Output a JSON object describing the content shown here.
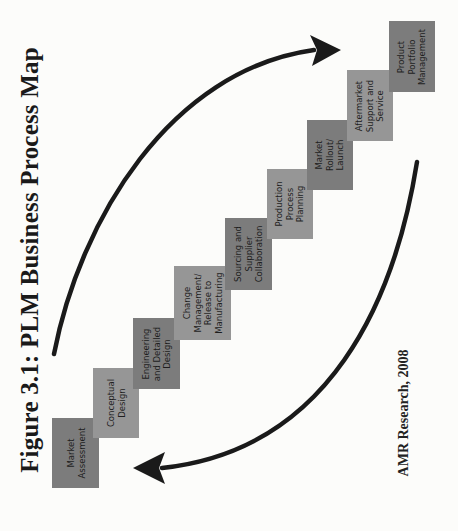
{
  "figure": {
    "title": "Figure 3.1: PLM Business Process Map",
    "attribution": "AMR Research, 2008"
  },
  "colors": {
    "background": "#fcfcfa",
    "step_dark": "#7c7c7c",
    "step_light": "#969696",
    "arrow": "#1a1a1a",
    "text": "#1e1e1e"
  },
  "steps": [
    {
      "label": "Market\nAssessment",
      "shade": "dark",
      "x": 52,
      "y": 418,
      "w": 47,
      "h": 70
    },
    {
      "label": "Conceptual\nDesign",
      "shade": "light",
      "x": 93,
      "y": 368,
      "w": 46,
      "h": 70
    },
    {
      "label": "Engineering\nand Detailed\nDesign",
      "shade": "dark",
      "x": 133,
      "y": 318,
      "w": 47,
      "h": 71
    },
    {
      "label": "Change\nManagement/\nRelease to\nManufacturing",
      "shade": "light",
      "x": 174,
      "y": 266,
      "w": 57,
      "h": 74
    },
    {
      "label": "Sourcing and\nSupplier\nCollaboration",
      "shade": "dark",
      "x": 225,
      "y": 218,
      "w": 47,
      "h": 72
    },
    {
      "label": "Production\nProcess\nPlanning",
      "shade": "light",
      "x": 267,
      "y": 169,
      "w": 46,
      "h": 70
    },
    {
      "label": "Market\nRollout/\nLaunch",
      "shade": "dark",
      "x": 307,
      "y": 120,
      "w": 46,
      "h": 70
    },
    {
      "label": "Aftermarket\nSupport and\nService",
      "shade": "light",
      "x": 347,
      "y": 70,
      "w": 46,
      "h": 71
    },
    {
      "label": "Product\nPortfolio\nManagement",
      "shade": "dark",
      "x": 389,
      "y": 21,
      "w": 46,
      "h": 71
    }
  ],
  "arrows": [
    {
      "name": "forward-arrow",
      "direction": "up-right",
      "path": "M 54 354 C 80 220, 170 70, 314 50",
      "head": "341,50 310,35 317,50 312,66"
    },
    {
      "name": "feedback-arrow",
      "direction": "down-left",
      "path": "M 417 162 C 395 300, 330 450, 162 468",
      "head": "133,468 165,452 159,468 165,484"
    }
  ]
}
